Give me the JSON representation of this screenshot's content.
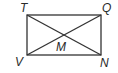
{
  "diagram": {
    "type": "geometry",
    "shape": "rectangle",
    "vertices": [
      {
        "name": "T",
        "x": 27,
        "y": 15
      },
      {
        "name": "Q",
        "x": 101,
        "y": 15
      },
      {
        "name": "N",
        "x": 101,
        "y": 55
      },
      {
        "name": "V",
        "x": 27,
        "y": 55
      }
    ],
    "intersection": {
      "name": "M",
      "x": 64,
      "y": 35
    },
    "diagonals": [
      "TN",
      "QV"
    ],
    "labels": {
      "T": "T",
      "Q": "Q",
      "N": "N",
      "V": "V",
      "M": "M"
    },
    "colors": {
      "stroke": "#333333",
      "text": "#2a2a2a"
    }
  }
}
